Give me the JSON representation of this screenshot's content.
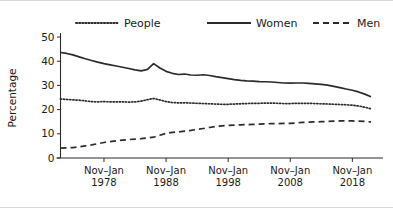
{
  "chart_data": {
    "type": "line",
    "title": "",
    "xlabel": "",
    "ylabel": "Percentage",
    "ylim": [
      0,
      50
    ],
    "yticks": [
      0,
      10,
      20,
      30,
      40,
      50
    ],
    "ytick_labels": [
      "0",
      "10",
      "20",
      "30",
      "40",
      "50"
    ],
    "xtick_labels": [
      "Nov–Jan\n1978",
      "Nov–Jan\n1988",
      "Nov–Jan\n1998",
      "Nov–Jan\n2008",
      "Nov–Jan\n2018"
    ],
    "xticks_top": [
      "Nov–Jan",
      "Nov–Jan",
      "Nov–Jan",
      "Nov–Jan",
      "Nov–Jan"
    ],
    "xticks_bottom": [
      "1978",
      "1988",
      "1998",
      "2008",
      "2018"
    ],
    "xtick_years": [
      1978,
      1988,
      1998,
      2008,
      2018
    ],
    "xlim": [
      1971,
      2021
    ],
    "grid": false,
    "legend_position": "top",
    "line_color": "#2b2b2b",
    "background": "#ffffff",
    "series": [
      {
        "name": "People",
        "style": "dotted",
        "x": [
          1971,
          1972,
          1973,
          1974,
          1975,
          1976,
          1977,
          1978,
          1979,
          1980,
          1981,
          1982,
          1983,
          1984,
          1985,
          1986,
          1987,
          1988,
          1989,
          1990,
          1991,
          1992,
          1993,
          1994,
          1995,
          1996,
          1997,
          1998,
          1999,
          2000,
          2001,
          2002,
          2003,
          2004,
          2005,
          2006,
          2007,
          2008,
          2009,
          2010,
          2011,
          2012,
          2013,
          2014,
          2015,
          2016,
          2017,
          2018,
          2019,
          2020,
          2021
        ],
        "values": [
          24.4,
          24.2,
          24.0,
          23.9,
          23.6,
          23.3,
          23.2,
          23.3,
          23.2,
          23.2,
          23.2,
          23.1,
          23.2,
          23.5,
          24.1,
          24.6,
          24.0,
          23.3,
          22.9,
          22.8,
          22.8,
          22.7,
          22.6,
          22.5,
          22.4,
          22.3,
          22.2,
          22.2,
          22.3,
          22.4,
          22.5,
          22.6,
          22.6,
          22.7,
          22.7,
          22.6,
          22.5,
          22.5,
          22.6,
          22.6,
          22.6,
          22.5,
          22.4,
          22.3,
          22.2,
          22.1,
          22.0,
          21.8,
          21.5,
          21.0,
          20.3
        ]
      },
      {
        "name": "Women",
        "style": "solid",
        "x": [
          1971,
          1972,
          1973,
          1974,
          1975,
          1976,
          1977,
          1978,
          1979,
          1980,
          1981,
          1982,
          1983,
          1984,
          1985,
          1986,
          1987,
          1988,
          1989,
          1990,
          1991,
          1992,
          1993,
          1994,
          1995,
          1996,
          1997,
          1998,
          1999,
          2000,
          2001,
          2002,
          2003,
          2004,
          2005,
          2006,
          2007,
          2008,
          2009,
          2010,
          2011,
          2012,
          2013,
          2014,
          2015,
          2016,
          2017,
          2018,
          2019,
          2020,
          2021
        ],
        "values": [
          43.6,
          43.2,
          42.6,
          41.8,
          41.0,
          40.3,
          39.6,
          39.0,
          38.5,
          38.0,
          37.5,
          37.0,
          36.4,
          36.0,
          36.6,
          39.0,
          37.2,
          35.8,
          35.0,
          34.5,
          34.7,
          34.3,
          34.2,
          34.4,
          34.1,
          33.6,
          33.2,
          32.8,
          32.4,
          32.1,
          31.9,
          31.8,
          31.6,
          31.5,
          31.4,
          31.2,
          31.0,
          30.9,
          31.0,
          31.0,
          30.8,
          30.6,
          30.4,
          30.1,
          29.6,
          29.1,
          28.5,
          28.0,
          27.3,
          26.4,
          25.3
        ]
      },
      {
        "name": "Men",
        "style": "dashed",
        "x": [
          1971,
          1972,
          1973,
          1974,
          1975,
          1976,
          1977,
          1978,
          1979,
          1980,
          1981,
          1982,
          1983,
          1984,
          1985,
          1986,
          1987,
          1988,
          1989,
          1990,
          1991,
          1992,
          1993,
          1994,
          1995,
          1996,
          1997,
          1998,
          1999,
          2000,
          2001,
          2002,
          2003,
          2004,
          2005,
          2006,
          2007,
          2008,
          2009,
          2010,
          2011,
          2012,
          2013,
          2014,
          2015,
          2016,
          2017,
          2018,
          2019,
          2020,
          2021
        ],
        "values": [
          4.1,
          4.2,
          4.3,
          4.6,
          5.0,
          5.4,
          5.9,
          6.4,
          6.8,
          7.1,
          7.4,
          7.6,
          7.8,
          8.0,
          8.3,
          8.6,
          9.4,
          10.2,
          10.6,
          10.8,
          11.1,
          11.4,
          11.8,
          12.2,
          12.6,
          13.0,
          13.3,
          13.5,
          13.6,
          13.7,
          13.8,
          13.9,
          14.0,
          14.1,
          14.2,
          14.2,
          14.3,
          14.3,
          14.5,
          14.7,
          14.8,
          14.9,
          15.0,
          15.1,
          15.2,
          15.3,
          15.3,
          15.3,
          15.2,
          15.1,
          14.9
        ]
      }
    ],
    "legend": [
      {
        "label": "People",
        "style": "dotted"
      },
      {
        "label": "Women",
        "style": "solid"
      },
      {
        "label": "Men",
        "style": "dashed"
      }
    ]
  }
}
